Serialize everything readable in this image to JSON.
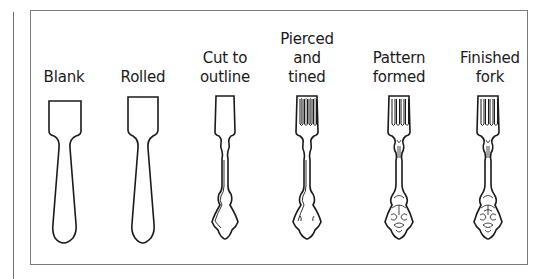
{
  "figure": {
    "stages": [
      {
        "line1": "",
        "line2": "",
        "line3": "Blank",
        "shape": "blank-icon"
      },
      {
        "line1": "",
        "line2": "",
        "line3": "Rolled",
        "shape": "rolled-blank-icon"
      },
      {
        "line1": "",
        "line2": "Cut to",
        "line3": "outline",
        "shape": "outline-cut-icon"
      },
      {
        "line1": "Pierced",
        "line2": "and",
        "line3": "tined",
        "shape": "tined-fork-icon"
      },
      {
        "line1": "",
        "line2": "Pattern",
        "line3": "formed",
        "shape": "patterned-fork-icon"
      },
      {
        "line1": "",
        "line2": "Finished",
        "line3": "fork",
        "shape": "finished-fork-icon"
      }
    ],
    "colors": {
      "stroke": "#1a1a1a",
      "frame": "#7a7a7a",
      "background": "#ffffff"
    }
  }
}
